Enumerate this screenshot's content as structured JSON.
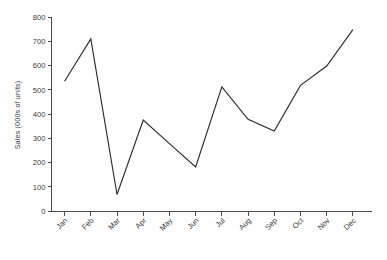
{
  "chart_data": {
    "type": "line",
    "title": "",
    "subtitle": "",
    "xlabel": "",
    "ylabel": "Sales (000s of units)",
    "categories": [
      "Jan",
      "Feb",
      "Mar",
      "Apr",
      "May",
      "Jun",
      "Jul",
      "Aug",
      "Sep",
      "Oct",
      "Nov",
      "Dec"
    ],
    "values": [
      535,
      710,
      68,
      375,
      278,
      182,
      512,
      378,
      330,
      518,
      598,
      748
    ],
    "series": [
      {
        "name": "Sales",
        "values": [
          535,
          710,
          68,
          375,
          278,
          182,
          512,
          378,
          330,
          518,
          598,
          748
        ]
      }
    ],
    "ylim": [
      0,
      800
    ],
    "ytick_values": [
      0,
      100,
      200,
      300,
      400,
      500,
      600,
      700,
      800
    ],
    "ytick_labels": [
      "0",
      "100",
      "200",
      "300",
      "400",
      "500",
      "600",
      "700",
      "800"
    ],
    "grid": false,
    "legend": false,
    "legend_position": "none",
    "xtick_label_rotation": 45,
    "line_color": "#2b2b2b",
    "axis_color": "#4a4a4a",
    "background_color": "#ffffff",
    "markers": false
  }
}
